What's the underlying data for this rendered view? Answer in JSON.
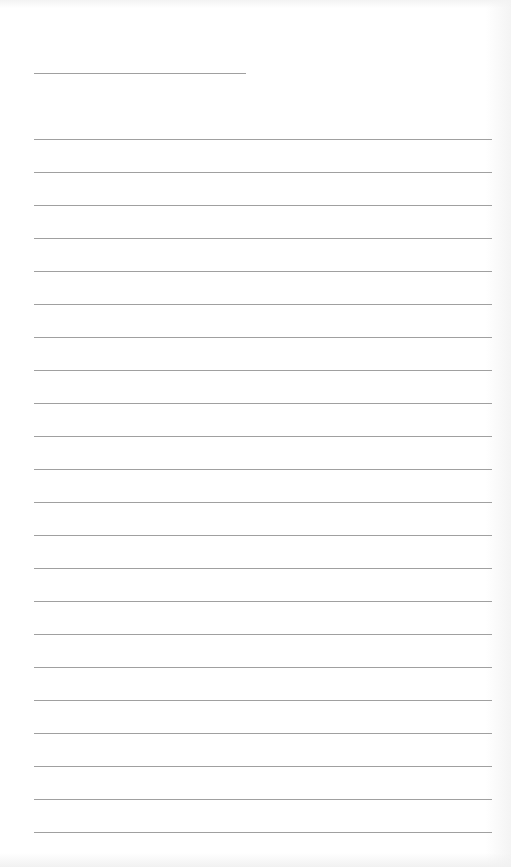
{
  "page": {
    "type": "lined-paper",
    "background_color": "#ffffff",
    "line_color": "#a0a0a0",
    "header_field": {
      "value": ""
    },
    "lines": [
      {
        "text": ""
      },
      {
        "text": ""
      },
      {
        "text": ""
      },
      {
        "text": ""
      },
      {
        "text": ""
      },
      {
        "text": ""
      },
      {
        "text": ""
      },
      {
        "text": ""
      },
      {
        "text": ""
      },
      {
        "text": ""
      },
      {
        "text": ""
      },
      {
        "text": ""
      },
      {
        "text": ""
      },
      {
        "text": ""
      },
      {
        "text": ""
      },
      {
        "text": ""
      },
      {
        "text": ""
      },
      {
        "text": ""
      },
      {
        "text": ""
      },
      {
        "text": ""
      },
      {
        "text": ""
      },
      {
        "text": ""
      }
    ],
    "line_count": 22
  }
}
